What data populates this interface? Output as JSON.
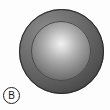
{
  "figure": {
    "width": 110,
    "height": 110,
    "background_color": "#fdfdfd",
    "panel_label": "B",
    "panel_label_shape": "circle",
    "objects": [
      {
        "name": "outer-shell",
        "shape": "circle",
        "center_x": 62,
        "center_y": 52,
        "radius": 43,
        "fill_light": "#8d8d8d",
        "fill_dark": "#2c2c2c",
        "rim_color": "#2a2a2a",
        "highlight_x_pct": 33,
        "highlight_y_pct": 27
      },
      {
        "name": "inner-dome",
        "shape": "circle",
        "center_x": 61,
        "center_y": 51,
        "radius": 30,
        "fill_light": "#f2f2f2",
        "fill_dark": "#464646",
        "rim_color": "#4a4a4a",
        "highlight_x_pct": 50,
        "highlight_y_pct": 38
      }
    ]
  }
}
